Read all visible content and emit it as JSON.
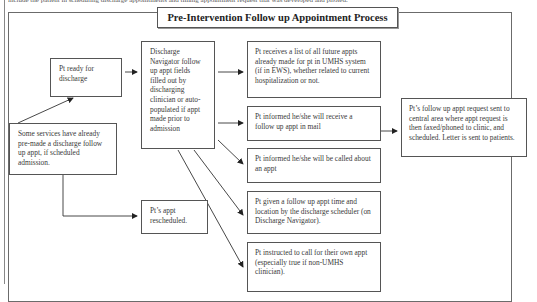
{
  "header_text": "include the patient in scheduling discharge appointments and timing appointment request that was developed and piloted.",
  "title": "Pre-Intervention Follow up Appointment Process",
  "nodes": {
    "ready": "Pt ready for discharge",
    "navigator": "Discharge Navigator follow up appt fields filled out by discharging clinician or auto-populated if appt made prior to admission",
    "premade": "Some services have already pre-made a discharge follow up appt, if scheduled admission.",
    "rescheduled": "Pt’s appt rescheduled.",
    "outcome_list": "Pt receives a list of all future appts already made for pt in UMHS system (if in EWS), whether related to current hospitalization or not.",
    "outcome_mail": "Pt informed he/she will receive a follow up appt in mail",
    "outcome_called": "Pt informed he/she will be called about an appt",
    "outcome_given": "Pt given a follow up appt time and location by the discharge scheduler (on Discharge Navigator).",
    "outcome_call_own": "Pt instructed to call for their own appt (especially true if non-UMHS clinician).",
    "central": "Pt’s follow up appt request sent to central area where appt request is then faxed/phoned to clinic, and scheduled.  Letter is sent to patients."
  },
  "edges": [
    [
      "premade",
      "ready"
    ],
    [
      "ready",
      "navigator"
    ],
    [
      "navigator",
      "outcome_list"
    ],
    [
      "navigator",
      "outcome_mail"
    ],
    [
      "navigator",
      "outcome_called"
    ],
    [
      "navigator",
      "outcome_given"
    ],
    [
      "navigator",
      "outcome_call_own"
    ],
    [
      "outcome_mail",
      "central"
    ],
    [
      "premade",
      "rescheduled"
    ]
  ]
}
